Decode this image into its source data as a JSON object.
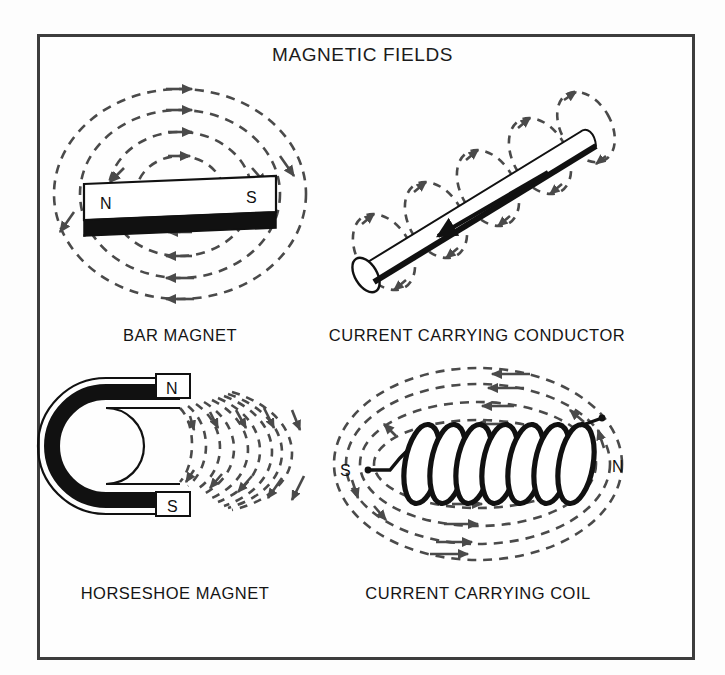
{
  "figure": {
    "title": "MAGNETIC FIELDS",
    "border_color": "#3d3d3d",
    "background_color": "#fdfdfd",
    "ink_color": "#111111"
  },
  "panels": [
    {
      "id": "bar-magnet",
      "caption": "BAR MAGNET",
      "pole_left": "N",
      "pole_right": "S",
      "field_style": "dashed concentric loops",
      "loop_count": 4
    },
    {
      "id": "current-carrying-conductor",
      "caption": "CURRENT CARRYING CONDUCTOR",
      "field_style": "dashed circular rings around cylinder",
      "ring_count": 5,
      "current_direction": "down-left"
    },
    {
      "id": "horseshoe-magnet",
      "caption": "HORSESHOE MAGNET",
      "pole_top": "N",
      "pole_bottom": "S",
      "field_style": "dashed arcs from N pole to S pole",
      "arc_count": 9
    },
    {
      "id": "current-carrying-coil",
      "caption": "CURRENT CARRYING COIL",
      "pole_left": "S",
      "pole_right": "N",
      "field_style": "dashed loops around solenoid",
      "turn_count": 7
    }
  ]
}
